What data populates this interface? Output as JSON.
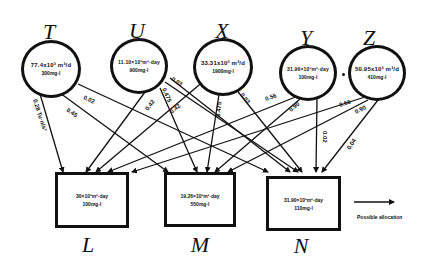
{
  "figure": {
    "sources": [
      {
        "id": "T",
        "letter": "T",
        "capacity": "77.4x10³ m³/d",
        "concentration": "300mg·l"
      },
      {
        "id": "U",
        "letter": "U",
        "capacity": "11.10×10³m³·day",
        "concentration": "900mg·l"
      },
      {
        "id": "X",
        "letter": "X",
        "capacity": "33.31x10³ m³/d",
        "concentration": "1900mg·l"
      },
      {
        "id": "Y",
        "letter": "Y",
        "capacity": "31.96×10³m³·day",
        "concentration": "100mg·l"
      },
      {
        "id": "Z",
        "letter": "Z",
        "capacity": "50.95x10³ m³/d",
        "concentration": "410mg·l"
      }
    ],
    "sinks": [
      {
        "id": "L",
        "letter": "L",
        "capacity": "30×10³m³·day",
        "concentration": "100mg·l"
      },
      {
        "id": "M",
        "letter": "M",
        "capacity": "19.26×10³m³·day",
        "concentration": "550mg·l"
      },
      {
        "id": "N",
        "letter": "N",
        "capacity": "31.90×10³m³·day",
        "concentration": "110mg·l"
      }
    ],
    "edge_labels": [
      {
        "from": "T",
        "to": "L",
        "text": "0.28 Tu·n/s³"
      },
      {
        "from": "T",
        "to": "N",
        "text": "0.02"
      },
      {
        "from": "T",
        "to": "M",
        "text": "0.45"
      },
      {
        "from": "U",
        "to": "N",
        "text": "0.03"
      },
      {
        "from": "U",
        "to": "L",
        "text": "0.42"
      },
      {
        "from": "U",
        "to": "M",
        "text": "0.475"
      },
      {
        "from": "U",
        "to": "N2",
        "text": "0.42"
      },
      {
        "from": "X",
        "to": "M",
        "text": "0.475"
      },
      {
        "from": "X",
        "to": "N",
        "text": "0.03"
      },
      {
        "from": "Y",
        "to": "L",
        "text": "0.56"
      },
      {
        "from": "Y",
        "to": "M",
        "text": "0.90"
      },
      {
        "from": "Y",
        "to": "N",
        "text": "0.02"
      },
      {
        "from": "Z",
        "to": "L",
        "text": "0.56"
      },
      {
        "from": "Z",
        "to": "M",
        "text": "0.90"
      },
      {
        "from": "Z",
        "to": "N",
        "text": "0.04"
      }
    ],
    "legend": {
      "label": "Possible allocation"
    }
  }
}
